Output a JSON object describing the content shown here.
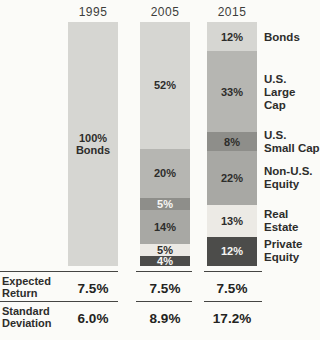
{
  "chart_data": {
    "type": "bar",
    "stacked": true,
    "orientation": "vertical",
    "categories": [
      "1995",
      "2005",
      "2015"
    ],
    "unit": "%",
    "ylim": [
      0,
      100
    ],
    "grid": false,
    "legend_position": "right",
    "series": [
      {
        "name": "Bonds",
        "values": [
          100,
          52,
          12
        ]
      },
      {
        "name": "U.S. Large Cap",
        "values": [
          0,
          20,
          33
        ]
      },
      {
        "name": "U.S. Small Cap",
        "values": [
          0,
          5,
          8
        ]
      },
      {
        "name": "Non-U.S. Equity",
        "values": [
          0,
          14,
          22
        ]
      },
      {
        "name": "Real Estate",
        "values": [
          0,
          5,
          13
        ]
      },
      {
        "name": "Private Equity",
        "values": [
          0,
          4,
          12
        ]
      }
    ],
    "footer_rows": [
      {
        "label": "Expected Return",
        "values": [
          "7.5%",
          "7.5%",
          "7.5%"
        ]
      },
      {
        "label": "Standard Deviation",
        "values": [
          "6.0%",
          "8.9%",
          "17.2%"
        ]
      }
    ]
  },
  "colors": {
    "bonds": "#d6d6d2",
    "us_large_cap": "#b6b6b2",
    "us_small_cap": "#8e8e8a",
    "non_us_equity": "#a8a8a4",
    "real_estate": "#eceae5",
    "private_equity": "#4c4c4a",
    "background": "#fbfbf8",
    "text_dark": "#2d2d2b",
    "text_light": "#f6f6f4",
    "rule": "#454543"
  },
  "headers": {
    "col1": "1995",
    "col2": "2005",
    "col3": "2015"
  },
  "bars": [
    {
      "year": "1995",
      "segments": [
        {
          "series": "Bonds",
          "pct": 100,
          "value_label": "100%\nBonds",
          "color": "bonds",
          "text": "dark"
        }
      ]
    },
    {
      "year": "2005",
      "segments": [
        {
          "series": "Bonds",
          "pct": 52,
          "value_label": "52%",
          "color": "bonds",
          "text": "dark"
        },
        {
          "series": "U.S. Large Cap",
          "pct": 20,
          "value_label": "20%",
          "color": "us_large_cap",
          "text": "dark"
        },
        {
          "series": "U.S. Small Cap",
          "pct": 5,
          "value_label": "5%",
          "color": "us_small_cap",
          "text": "light"
        },
        {
          "series": "Non-U.S. Equity",
          "pct": 14,
          "value_label": "14%",
          "color": "non_us_equity",
          "text": "dark"
        },
        {
          "series": "Real Estate",
          "pct": 5,
          "value_label": "5%",
          "color": "real_estate",
          "text": "dark"
        },
        {
          "series": "Private Equity",
          "pct": 4,
          "value_label": "4%",
          "color": "private_equity",
          "text": "light"
        }
      ]
    },
    {
      "year": "2015",
      "segments": [
        {
          "series": "Bonds",
          "pct": 12,
          "value_label": "12%",
          "color": "bonds",
          "text": "dark"
        },
        {
          "series": "U.S. Large Cap",
          "pct": 33,
          "value_label": "33%",
          "color": "us_large_cap",
          "text": "dark"
        },
        {
          "series": "U.S. Small Cap",
          "pct": 8,
          "value_label": "8%",
          "color": "us_small_cap",
          "text": "dark"
        },
        {
          "series": "Non-U.S. Equity",
          "pct": 22,
          "value_label": "22%",
          "color": "non_us_equity",
          "text": "dark"
        },
        {
          "series": "Real Estate",
          "pct": 13,
          "value_label": "13%",
          "color": "real_estate",
          "text": "dark"
        },
        {
          "series": "Private Equity",
          "pct": 12,
          "value_label": "12%",
          "color": "private_equity",
          "text": "light"
        }
      ]
    }
  ],
  "legend": [
    {
      "label": "Bonds"
    },
    {
      "label": "U.S.\nLarge\nCap"
    },
    {
      "label": "U.S.\nSmall Cap"
    },
    {
      "label": "Non-U.S.\nEquity"
    },
    {
      "label": "Real\nEstate"
    },
    {
      "label": "Private\nEquity"
    }
  ],
  "table": {
    "rows": [
      {
        "label": "Expected\nReturn",
        "values": [
          "7.5%",
          "7.5%",
          "7.5%"
        ]
      },
      {
        "label": "Standard\nDeviation",
        "values": [
          "6.0%",
          "8.9%",
          "17.2%"
        ]
      }
    ]
  }
}
